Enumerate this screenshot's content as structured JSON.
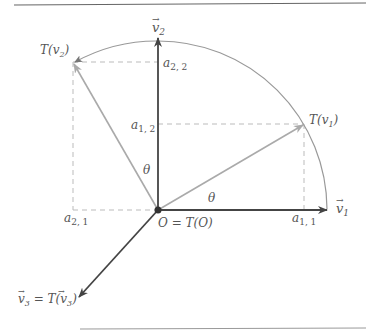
{
  "diagram": {
    "labels": {
      "v1": "v",
      "v1_sub": "1",
      "v2": "v",
      "v2_sub": "2",
      "Tv1_pre": "T(v",
      "Tv1_sub": "1",
      "Tv1_post": ")",
      "Tv2_pre": "T(v",
      "Tv2_sub": "2",
      "Tv2_post": ")",
      "a11": "a",
      "a11_sub": "1, 1",
      "a12": "a",
      "a12_sub": "1, 2",
      "a21": "a",
      "a21_sub": "2, 1",
      "a22": "a",
      "a22_sub": "2, 2",
      "theta": "θ",
      "origin": "O = T(O)",
      "v3_left": "v",
      "v3_sub": "3",
      "v3_mid": " = T(",
      "v3_right": "v",
      "v3_sub2": "3",
      "v3_end": ")"
    },
    "colors": {
      "axis": "#444444",
      "rotated": "#aaaaaa",
      "arc": "#999999",
      "dashed": "#bbbbbb",
      "rule": "#666666"
    }
  }
}
